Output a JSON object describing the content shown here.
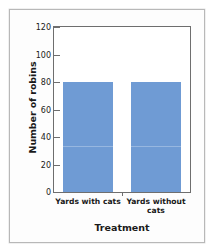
{
  "chart_data": {
    "type": "bar",
    "title": "",
    "categories": [
      "Yards with cats",
      "Yards without cats"
    ],
    "values": [
      80,
      80
    ],
    "xlabel": "Treatment",
    "ylabel": "Number of robins",
    "ylim": [
      0,
      120
    ],
    "ytick_labels": [
      "0",
      "20",
      "40",
      "60",
      "80",
      "100",
      "120"
    ],
    "ytick_values": [
      0,
      20,
      40,
      60,
      80,
      100,
      120
    ],
    "grid": false,
    "legend": false,
    "bar_color": "#6f9bd4",
    "axis_color": "#6e6e6e"
  }
}
